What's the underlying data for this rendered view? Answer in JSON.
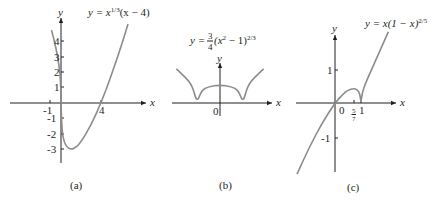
{
  "chart_data": [
    {
      "type": "line",
      "panel": "(a)",
      "title": "y = x^{1/3}(x − 4)",
      "equation": {
        "lhs": "y = x",
        "exp": "1/3",
        "rest": "(x − 4)"
      },
      "xlabel": "x",
      "ylabel": "y",
      "xticks": [
        "-1",
        "4"
      ],
      "yticks": [
        "4",
        "3",
        "2",
        "1",
        "-1",
        "-2",
        "-3"
      ],
      "ylim": [
        -3.8,
        5.5
      ],
      "xlim": [
        -5,
        8.5
      ],
      "grid": false,
      "series": [
        {
          "name": "y = x^(1/3)(x-4)",
          "x": [
            -0.95,
            -0.5,
            -0.2,
            -0.05,
            0,
            0.1,
            0.3,
            0.6,
            1.0,
            1.5,
            2,
            3,
            4,
            5,
            6,
            6.7
          ],
          "y": [
            4.7,
            3.56,
            2.44,
            1.49,
            0,
            -1.81,
            -2.49,
            -2.86,
            -3.0,
            -2.86,
            -2.52,
            -1.44,
            0,
            1.71,
            3.63,
            5.09
          ]
        }
      ],
      "annotations": [
        "local min at x = 1, y = -3",
        "vertical tangent at x = 0"
      ]
    },
    {
      "type": "line",
      "panel": "(b)",
      "title": "y = 3/4 (x² − 1)^{2/3}",
      "equation": {
        "lhs": "y = ",
        "num": "3",
        "den": "4",
        "mid": "(x",
        "sq": "2",
        "rest": " − 1)",
        "exp": "2/3"
      },
      "xlabel": "x",
      "ylabel": "y",
      "xticks": [
        "0"
      ],
      "yticks": [],
      "xlim": [
        -2.2,
        2.3
      ],
      "ylim": [
        -0.5,
        1.5
      ],
      "grid": false,
      "series": [
        {
          "name": "y = 3/4 (x^2 - 1)^(2/3)",
          "x": [
            -1.9,
            -1.5,
            -1.2,
            -1.0,
            -0.8,
            -0.5,
            0,
            0.5,
            0.8,
            1.0,
            1.2,
            1.5,
            1.9
          ],
          "y": [
            1.42,
            1.07,
            0.71,
            0,
            0.54,
            0.68,
            0.75,
            0.68,
            0.54,
            0,
            0.71,
            1.07,
            1.42
          ]
        }
      ],
      "annotations": [
        "cusps at x = -1 and x = 1",
        "local max at x = 0, y = 3/4"
      ]
    },
    {
      "type": "line",
      "panel": "(c)",
      "title": "y = x(1 − x)^{2/5}",
      "equation": {
        "lhs": "y = x(1 − x)",
        "exp": "2/5"
      },
      "xlabel": "x",
      "ylabel": "y",
      "xticks": [
        "0",
        "5/7",
        "1"
      ],
      "yticks": [
        "1",
        "-1"
      ],
      "xlim": [
        -1.6,
        2.3
      ],
      "ylim": [
        -2.1,
        2.1
      ],
      "grid": false,
      "series": [
        {
          "name": "y = x(1-x)^(2/5)",
          "x": [
            -1.46,
            -1.0,
            -0.5,
            0,
            0.3,
            0.5,
            0.714,
            0.85,
            0.95,
            1.0,
            1.05,
            1.2,
            1.5,
            2.05
          ],
          "y": [
            -2.09,
            -1.32,
            -0.59,
            0,
            0.26,
            0.38,
            0.43,
            0.4,
            0.29,
            0,
            0.32,
            0.63,
            1.14,
            2.09
          ]
        }
      ],
      "annotations": [
        "local max at x = 5/7",
        "cusp at x = 1"
      ]
    }
  ],
  "captions": [
    "(a)",
    "(b)",
    "(c)"
  ],
  "axis_labels": {
    "x": "x",
    "y": "y"
  },
  "colors": {
    "axis": "#231f20",
    "curve": "#8c8c8c",
    "background": "#ffffff"
  }
}
